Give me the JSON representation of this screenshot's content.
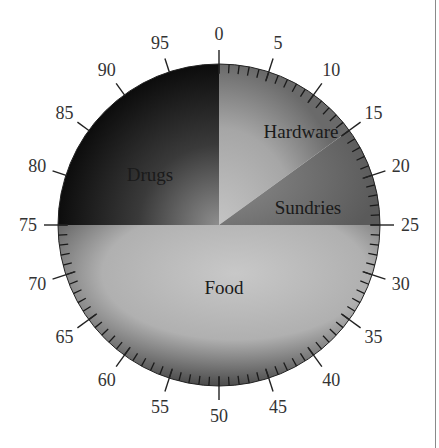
{
  "chart_data": {
    "type": "pie",
    "title": "",
    "categories": [
      "Hardware",
      "Sundries",
      "Food",
      "Drugs"
    ],
    "values": [
      15,
      10,
      50,
      25
    ],
    "ranges": [
      [
        0,
        15
      ],
      [
        15,
        25
      ],
      [
        25,
        75
      ],
      [
        75,
        100
      ]
    ],
    "scale": {
      "min": 0,
      "max": 100,
      "major_step": 5,
      "minor_step": 1
    },
    "major_tick_labels": [
      "0",
      "5",
      "10",
      "15",
      "20",
      "25",
      "30",
      "35",
      "40",
      "45",
      "50",
      "55",
      "60",
      "65",
      "70",
      "75",
      "80",
      "85",
      "90",
      "95"
    ],
    "minor_ticks_range": [
      0,
      75
    ],
    "colors": {
      "Hardware": "#a9a9a9",
      "Sundries": "#7c7c7c",
      "Food": "#b4b4b4",
      "Drugs": "#2a2a2a"
    },
    "legend": "none",
    "grid": false
  },
  "labels": {
    "hardware": "Hardware",
    "sundries": "Sundries",
    "food": "Food",
    "drugs": "Drugs"
  }
}
